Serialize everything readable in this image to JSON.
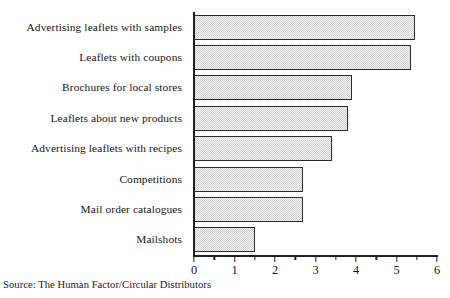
{
  "chart_data": {
    "type": "bar",
    "orientation": "horizontal",
    "title": "",
    "xlabel": "",
    "ylabel": "",
    "xlim": [
      0,
      6
    ],
    "grid": false,
    "legend": null,
    "x_ticks": [
      0,
      1,
      2,
      3,
      4,
      5,
      6
    ],
    "x_tick_labels": [
      "0",
      "1",
      "2",
      "3",
      "4",
      "5",
      "6"
    ],
    "x_minor_tick_step": 0.5,
    "categories": [
      "Advertising leaflets with samples",
      "Leaflets with coupons",
      "Brochures for local stores",
      "Leaflets about new products",
      "Advertising leaflets with recipes",
      "Competitions",
      "Mail order catalogues",
      "Mailshots"
    ],
    "values": [
      5.45,
      5.35,
      3.9,
      3.8,
      3.4,
      2.7,
      2.7,
      1.5
    ],
    "bar_fill_color": "#e2e2e2",
    "bar_edge_color": "#2b2b2b",
    "axis_color": "#1f1f1f"
  },
  "source": {
    "text": "Source: The Human Factor/Circular Distributors"
  }
}
